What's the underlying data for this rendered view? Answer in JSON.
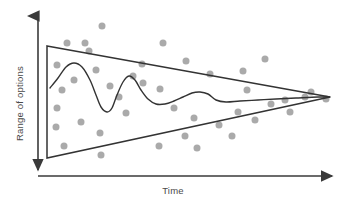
{
  "figure": {
    "title": "",
    "axes": {
      "x": {
        "label": "Time",
        "arrow": "right-arrow-icon",
        "style": "single-headed arrow pointing right"
      },
      "y": {
        "label": "Range of options",
        "arrow": "double-arrow-icon",
        "style": "double-headed vertical arrow"
      }
    },
    "colors": {
      "line": "#333333",
      "axis": "#3a3a3a",
      "dot": "#aaaaaa",
      "background": "#ffffff",
      "label_text": "#4a4a4a"
    }
  },
  "chart_data": {
    "type": "scatter",
    "title": "",
    "xlabel": "Time",
    "ylabel": "Range of options",
    "xlim": [
      0,
      100
    ],
    "ylim": [
      0,
      100
    ],
    "grid": false,
    "legend": "none",
    "annotations": [
      "Converging funnel (cone of uncertainty) narrowing left to right",
      "Wavy trajectory line damping toward the funnel apex"
    ],
    "funnel": {
      "name": "cone-of-uncertainty",
      "upper_bound": [
        [
          47,
          46
        ],
        [
          330,
          97
        ]
      ],
      "lower_bound": [
        [
          47,
          158
        ],
        [
          330,
          97
        ]
      ],
      "left_edge": [
        [
          47,
          46
        ],
        [
          47,
          158
        ]
      ],
      "apex": [
        330,
        97
      ]
    },
    "trend_line": {
      "name": "damped-oscillation",
      "points": [
        [
          50,
          88
        ],
        [
          58,
          78
        ],
        [
          66,
          67
        ],
        [
          74,
          63
        ],
        [
          82,
          67
        ],
        [
          90,
          80
        ],
        [
          96,
          95
        ],
        [
          101,
          107
        ],
        [
          107,
          112
        ],
        [
          112,
          108
        ],
        [
          117,
          95
        ],
        [
          123,
          82
        ],
        [
          129,
          76
        ],
        [
          135,
          80
        ],
        [
          141,
          90
        ],
        [
          148,
          99
        ],
        [
          156,
          104
        ],
        [
          165,
          104
        ],
        [
          174,
          101
        ],
        [
          183,
          97
        ],
        [
          192,
          93
        ],
        [
          200,
          92
        ],
        [
          208,
          94
        ],
        [
          216,
          100
        ],
        [
          226,
          102
        ],
        [
          240,
          101
        ],
        [
          258,
          100
        ],
        [
          276,
          99
        ],
        [
          296,
          98
        ],
        [
          318,
          97
        ],
        [
          330,
          97
        ]
      ]
    },
    "series": [
      {
        "name": "options",
        "marker": "circle",
        "marker_size": 7,
        "color": "#aaaaaa",
        "points": [
          [
            102,
            26
          ],
          [
            67,
            43
          ],
          [
            85,
            43
          ],
          [
            163,
            43
          ],
          [
            186,
            61
          ],
          [
            265,
            59
          ],
          [
            142,
            64
          ],
          [
            89,
            51
          ],
          [
            57,
            65
          ],
          [
            143,
            83
          ],
          [
            110,
            86
          ],
          [
            74,
            80
          ],
          [
            57,
            108
          ],
          [
            133,
            76
          ],
          [
            119,
            97
          ],
          [
            81,
            122
          ],
          [
            160,
            89
          ],
          [
            210,
            74
          ],
          [
            56,
            127
          ],
          [
            100,
            133
          ],
          [
            126,
            113
          ],
          [
            64,
            146
          ],
          [
            101,
            155
          ],
          [
            159,
            146
          ],
          [
            185,
            136
          ],
          [
            194,
            118
          ],
          [
            247,
            90
          ],
          [
            238,
            112
          ],
          [
            219,
            125
          ],
          [
            197,
            148
          ],
          [
            232,
            136
          ],
          [
            255,
            120
          ],
          [
            271,
            104
          ],
          [
            285,
            100
          ],
          [
            290,
            112
          ],
          [
            305,
            97
          ],
          [
            311,
            92
          ],
          [
            326,
            99
          ],
          [
            243,
            71
          ],
          [
            174,
            108
          ],
          [
            62,
            90
          ],
          [
            96,
            70
          ]
        ]
      }
    ]
  }
}
